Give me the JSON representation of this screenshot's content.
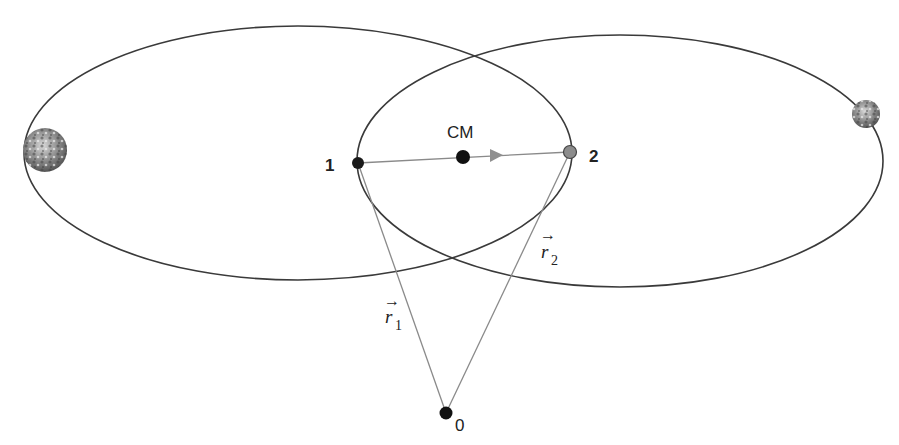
{
  "diagram": {
    "labels": {
      "cm": "CM",
      "body1": "1",
      "body2": "2",
      "origin": "0",
      "r1_symbol": "r",
      "r1_sub": "1",
      "r2_symbol": "r",
      "r2_sub": "2",
      "arrow_glyph": "→"
    },
    "colors": {
      "orbit_stroke": "#3a3a3a",
      "vector_stroke": "#8a8a8a",
      "body1_fill": "#1a1a1a",
      "body2_fill": "#8c8c8c",
      "cm_fill": "#111111",
      "origin_fill": "#111111",
      "arrow_fill": "#8a8a8a",
      "planet_large": "#7a7a7a",
      "planet_small": "#9a9a9a"
    },
    "elements": {
      "orbit_left": {
        "cx": 298,
        "cy": 153,
        "rx": 274,
        "ry": 127
      },
      "orbit_right": {
        "cx": 620,
        "cy": 161,
        "rx": 263,
        "ry": 126
      },
      "point1": {
        "x": 358,
        "y": 163
      },
      "point2": {
        "x": 570,
        "y": 152
      },
      "cm": {
        "x": 463,
        "y": 157
      },
      "origin": {
        "x": 446,
        "y": 413
      },
      "planet_large": {
        "x": 45,
        "y": 150,
        "r": 22
      },
      "planet_small": {
        "x": 866,
        "y": 114,
        "r": 14
      }
    }
  }
}
